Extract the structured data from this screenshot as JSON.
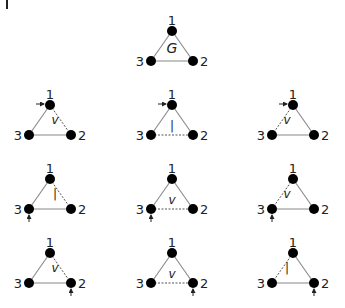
{
  "root_graph": {
    "label": "G",
    "nodes": [
      {
        "id": "1",
        "x": 172,
        "y": 31
      },
      {
        "id": "2",
        "x": 193,
        "y": 61
      },
      {
        "id": "3",
        "x": 151,
        "y": 61
      }
    ],
    "edges": [
      {
        "from": "1",
        "to": "2",
        "style": "solid"
      },
      {
        "from": "2",
        "to": "3",
        "style": "solid"
      },
      {
        "from": "3",
        "to": "1",
        "style": "solid"
      }
    ]
  },
  "colors": {
    "node": "#000000",
    "edge": "#888888",
    "text": "#222222"
  },
  "grid": {
    "columns": [
      50,
      172,
      293
    ],
    "rows": [
      105,
      179,
      253
    ],
    "triangle": {
      "dx": 21,
      "dy": 30
    },
    "cells": [
      {
        "row": 0,
        "col": 0,
        "dashed_edge": "1-2",
        "edge_label": "v",
        "arrow_node": "1",
        "arrow_dir": "left"
      },
      {
        "row": 0,
        "col": 1,
        "dashed_edge": "3-2",
        "edge_label": "I",
        "arrow_node": "1",
        "arrow_dir": "left"
      },
      {
        "row": 0,
        "col": 2,
        "dashed_edge": "1-3",
        "edge_label": "v",
        "arrow_node": "1",
        "arrow_dir": "left"
      },
      {
        "row": 1,
        "col": 0,
        "dashed_edge": "1-2",
        "edge_label": "I",
        "arrow_node": "3",
        "arrow_dir": "below"
      },
      {
        "row": 1,
        "col": 1,
        "dashed_edge": "3-2",
        "edge_label": "v",
        "arrow_node": "3",
        "arrow_dir": "below"
      },
      {
        "row": 1,
        "col": 2,
        "dashed_edge": "1-3",
        "edge_label": "v",
        "arrow_node": "3",
        "arrow_dir": "below"
      },
      {
        "row": 2,
        "col": 0,
        "dashed_edge": "1-2",
        "edge_label": "v",
        "arrow_node": "2",
        "arrow_dir": "below"
      },
      {
        "row": 2,
        "col": 1,
        "dashed_edge": "3-2",
        "edge_label": "v",
        "arrow_node": "2",
        "arrow_dir": "below"
      },
      {
        "row": 2,
        "col": 2,
        "dashed_edge": "1-3",
        "edge_label": "I",
        "arrow_node": "2",
        "arrow_dir": "below"
      }
    ]
  },
  "node_labels": {
    "n1": "1",
    "n2": "2",
    "n3": "3"
  }
}
